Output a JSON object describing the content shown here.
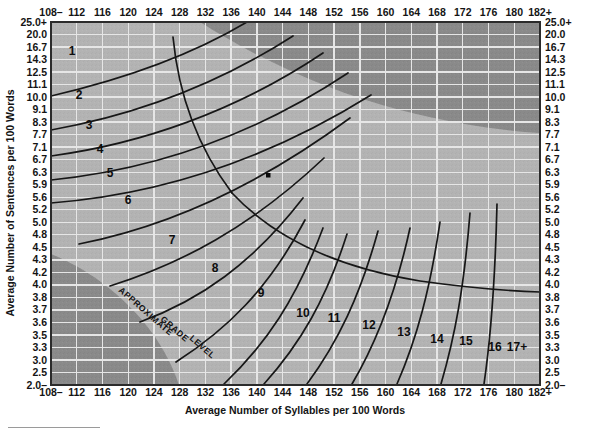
{
  "chart_data": {
    "type": "line",
    "xlabel": "Average Number of Syllables per 100 Words",
    "ylabel": "Average Number of Sentences per 100 Words",
    "grid": true,
    "legend_position": "none",
    "xlim": [
      108,
      182
    ],
    "ylim": [
      2.0,
      25.0
    ],
    "x_ticks": [
      "108–",
      "112",
      "116",
      "120",
      "124",
      "128",
      "132",
      "136",
      "140",
      "144",
      "148",
      "152",
      "156",
      "160",
      "164",
      "168",
      "172",
      "176",
      "180",
      "182+"
    ],
    "x_tick_values": [
      108,
      112,
      116,
      120,
      124,
      128,
      132,
      136,
      140,
      144,
      148,
      152,
      156,
      160,
      164,
      168,
      172,
      176,
      180,
      182
    ],
    "y_ticks": [
      "25.0+",
      "20.0",
      "16.7",
      "14.3",
      "12.5",
      "11.1",
      "10.0",
      "9.1",
      "8.3",
      "7.7",
      "7.1",
      "6.7",
      "6.3",
      "5.9",
      "5.6",
      "5.2",
      "5.0",
      "4.8",
      "4.5",
      "4.3",
      "4.2",
      "4.0",
      "3.8",
      "3.7",
      "3.6",
      "3.5",
      "3.3",
      "3.0",
      "2.5",
      "2.0–"
    ],
    "y_tick_values": [
      25.0,
      20.0,
      16.7,
      14.3,
      12.5,
      11.1,
      10.0,
      9.1,
      8.3,
      7.7,
      7.1,
      6.7,
      6.3,
      5.9,
      5.6,
      5.2,
      5.0,
      4.8,
      4.5,
      4.3,
      4.2,
      4.0,
      3.8,
      3.7,
      3.6,
      3.5,
      3.3,
      3.0,
      2.5,
      2.0
    ],
    "grade_band_label": "APPROXIMATE  GRADE  LEVEL",
    "grade_levels": [
      "1",
      "2",
      "3",
      "4",
      "5",
      "6",
      "7",
      "8",
      "9",
      "10",
      "11",
      "12",
      "13",
      "14",
      "15",
      "16",
      "17+"
    ],
    "series": [
      {
        "name": "plot-point",
        "x": 140.5,
        "y": 6.4,
        "marker": "square"
      }
    ],
    "shaded_regions": [
      {
        "name": "upper-right-invalid",
        "label": "long words / long sentences — invalid",
        "color": "#8a8a8a"
      },
      {
        "name": "lower-left-invalid",
        "label": "short words / short sentences — invalid",
        "color": "#8a8a8a"
      }
    ],
    "colors": {
      "plot_background": "#b3b3b3",
      "invalid_region": "#8a8a8a",
      "gridline": "#e2e2e2",
      "curve": "#111111",
      "border": "#2a2a2a",
      "text": "#141414"
    }
  }
}
